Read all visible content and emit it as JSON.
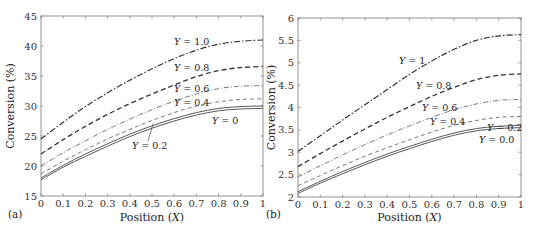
{
  "chart_data": [
    {
      "type": "line",
      "panel_label": "(a)",
      "title": "",
      "xlabel": "Position (X)",
      "ylabel": "Conversion (%)",
      "xlim": [
        0,
        1
      ],
      "ylim": [
        15,
        45
      ],
      "xticks": [
        "0",
        "0.1",
        "0.2",
        "0.3",
        "0.4",
        "0.5",
        "0.6",
        "0.7",
        "0.8",
        "0.9",
        "1"
      ],
      "yticks": [
        "15",
        "20",
        "25",
        "30",
        "35",
        "40",
        "45"
      ],
      "grid": false,
      "x": [
        0,
        0.1,
        0.2,
        0.3,
        0.4,
        0.5,
        0.6,
        0.7,
        0.8,
        0.9,
        1.0
      ],
      "series": [
        {
          "name": "Y = 1.0",
          "style": "dash-dot",
          "values": [
            24.5,
            27.3,
            29.9,
            32.2,
            34.3,
            36.2,
            37.9,
            39.3,
            40.3,
            40.8,
            41.0
          ]
        },
        {
          "name": "Y = 0.8",
          "style": "dash",
          "values": [
            22.0,
            24.4,
            26.6,
            28.6,
            30.4,
            32.0,
            33.5,
            34.9,
            35.9,
            36.4,
            36.6
          ]
        },
        {
          "name": "Y = 0.6",
          "style": "dash-dot-thin",
          "values": [
            20.0,
            22.2,
            24.2,
            26.1,
            27.8,
            29.4,
            30.8,
            32.0,
            32.9,
            33.3,
            33.4
          ]
        },
        {
          "name": "Y = 0.4",
          "style": "dash-thin",
          "values": [
            18.7,
            20.8,
            22.7,
            24.5,
            26.1,
            27.6,
            28.9,
            30.0,
            30.7,
            31.1,
            31.2
          ]
        },
        {
          "name": "Y = 0.2",
          "style": "solid",
          "values": [
            18.0,
            20.1,
            22.0,
            23.7,
            25.3,
            26.7,
            27.9,
            28.9,
            29.6,
            29.9,
            30.0
          ]
        },
        {
          "name": "Y = 0",
          "style": "solid",
          "values": [
            17.7,
            19.8,
            21.6,
            23.3,
            24.9,
            26.3,
            27.5,
            28.5,
            29.2,
            29.5,
            29.6
          ]
        }
      ],
      "annotations": [
        "Y = 1.0",
        "Y = 0.8",
        "Y = 0.6",
        "Y = 0.4",
        "Y = 0.2",
        "Y = 0"
      ]
    },
    {
      "type": "line",
      "panel_label": "(b)",
      "title": "",
      "xlabel": "Position (X)",
      "ylabel": "Conversion (%)",
      "xlim": [
        0,
        1
      ],
      "ylim": [
        2,
        6
      ],
      "xticks": [
        "0",
        "0.1",
        "0.2",
        "0.3",
        "0.4",
        "0.5",
        "0.6",
        "0.7",
        "0.8",
        "0.9",
        "1"
      ],
      "yticks": [
        "2",
        "2.5",
        "3",
        "3.5",
        "4",
        "4.5",
        "5",
        "5.5",
        "6"
      ],
      "grid": false,
      "x": [
        0,
        0.1,
        0.2,
        0.3,
        0.4,
        0.5,
        0.6,
        0.7,
        0.8,
        0.9,
        1.0
      ],
      "series": [
        {
          "name": "Y = 1",
          "style": "dash-dot",
          "values": [
            3.02,
            3.37,
            3.72,
            4.06,
            4.4,
            4.74,
            5.04,
            5.3,
            5.5,
            5.6,
            5.63
          ]
        },
        {
          "name": "Y = 0.8",
          "style": "dash",
          "values": [
            2.68,
            2.97,
            3.25,
            3.52,
            3.78,
            4.02,
            4.25,
            4.45,
            4.62,
            4.72,
            4.75
          ]
        },
        {
          "name": "Y = 0.6",
          "style": "dash-dot-thin",
          "values": [
            2.45,
            2.7,
            2.94,
            3.17,
            3.39,
            3.59,
            3.78,
            3.95,
            4.08,
            4.16,
            4.18
          ]
        },
        {
          "name": "Y = 0.4",
          "style": "dash-thin",
          "values": [
            2.25,
            2.48,
            2.7,
            2.91,
            3.1,
            3.28,
            3.45,
            3.6,
            3.71,
            3.78,
            3.8
          ]
        },
        {
          "name": "Y = 0.2",
          "style": "solid",
          "values": [
            2.12,
            2.35,
            2.57,
            2.77,
            2.96,
            3.13,
            3.29,
            3.43,
            3.53,
            3.58,
            3.6
          ]
        },
        {
          "name": "Y = 0.0",
          "style": "solid",
          "values": [
            2.08,
            2.31,
            2.52,
            2.72,
            2.91,
            3.08,
            3.24,
            3.38,
            3.48,
            3.53,
            3.55
          ]
        }
      ],
      "annotations": [
        "Y = 1",
        "Y = 0.8",
        "Y = 0.6",
        "Y = 0.4",
        "Y = 0.2",
        "Y = 0.0"
      ]
    }
  ],
  "panels": [
    {
      "label": "(a)",
      "xlabel_pre": "Position (",
      "xlabel_var": "X",
      "xlabel_post": ")",
      "ylabel": "Conversion (%)"
    },
    {
      "label": "(b)",
      "xlabel_pre": "Position (",
      "xlabel_var": "X",
      "xlabel_post": ")",
      "ylabel": "Conversion (%)"
    }
  ]
}
